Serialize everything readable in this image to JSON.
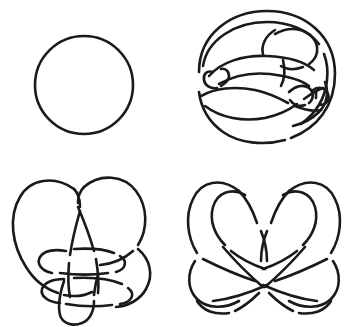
{
  "figure": {
    "background_color": "#ffffff",
    "stroke_color": "#1a1a1a",
    "stroke_width_px": 2.6,
    "width_px": 354,
    "height_px": 327,
    "layout": "2x2 grid of knot projections, no labels or captions visible"
  },
  "panels": [
    {
      "position": "top-left",
      "name": "unknot-circle",
      "description": "Simple closed circle, the standard unknot",
      "crossings": 0,
      "center_px": [
        84,
        85
      ],
      "radius_px": 49
    },
    {
      "position": "top-right",
      "name": "complex-unknot-projection",
      "description": "Large oval outer loop with many interior strands and tight curls, a complicated projection",
      "crossings": 10,
      "center_px": [
        265,
        82
      ],
      "radius_px": 78
    },
    {
      "position": "bottom-left",
      "name": "three-lobe-knot",
      "description": "Three large rounded lobes interlocked with a long vertical loop hanging below",
      "crossings": 7,
      "center_px": [
        88,
        245
      ],
      "radius_px": 78
    },
    {
      "position": "bottom-right",
      "name": "four-lobe-knot",
      "description": "Two upper arches over two broad crossing sweeps, near four-fold symmetric",
      "crossings": 8,
      "center_px": [
        265,
        245
      ],
      "radius_px": 78
    }
  ]
}
